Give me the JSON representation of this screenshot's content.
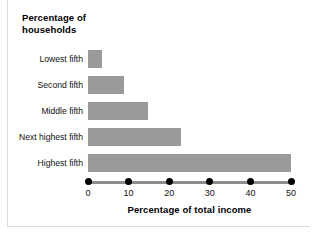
{
  "chart_data": {
    "type": "bar",
    "orientation": "horizontal",
    "title": "Percentage of\nhouseholds",
    "xlabel": "Percentage of total income",
    "ylabel": "Percentage of households",
    "categories": [
      "Lowest fifth",
      "Second fifth",
      "Middle fifth",
      "Next highest fifth",
      "Highest fifth"
    ],
    "values": [
      3.4,
      8.9,
      14.8,
      23.0,
      50.1
    ],
    "xlim": [
      0,
      50
    ],
    "xticks": [
      0,
      10,
      20,
      30,
      40,
      50
    ],
    "xtick_labels": [
      "0",
      "10",
      "20",
      "30",
      "40",
      "50"
    ],
    "grid": false,
    "legend": false,
    "bar_color": "#9a9a9a",
    "axis_color": "#8e8e8e",
    "tick_marker": "filled-circle",
    "tick_marker_color": "#000000",
    "background": "#ffffff"
  }
}
